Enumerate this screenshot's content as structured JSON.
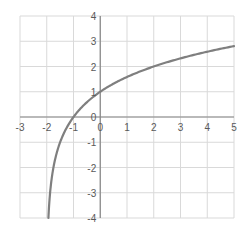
{
  "chart_data": {
    "type": "line",
    "title": "",
    "xlabel": "",
    "ylabel": "",
    "function": "y = log2(x + 2)",
    "xlim": [
      -3,
      5
    ],
    "ylim": [
      -4,
      4
    ],
    "grid": true,
    "legend": null,
    "x_ticks": [
      "-3",
      "-2",
      "-1",
      "0",
      "1",
      "2",
      "3",
      "4",
      "5"
    ],
    "y_ticks": [
      "4",
      "3",
      "2",
      "1",
      "0",
      "-1",
      "-2",
      "-3",
      "-4"
    ],
    "series": [
      {
        "name": "curve",
        "color": "#7f7f7f",
        "x": [
          -1.9375,
          -1.875,
          -1.75,
          -1.5,
          -1.25,
          -1,
          -0.5,
          0,
          0.5,
          1,
          1.5,
          2,
          2.5,
          3,
          3.5,
          4,
          4.5,
          5
        ],
        "y": [
          -4.0,
          -3.0,
          -2.0,
          -1.0,
          -0.415,
          0.0,
          0.585,
          1.0,
          1.322,
          1.585,
          1.807,
          2.0,
          2.17,
          2.322,
          2.459,
          2.585,
          2.7,
          2.807
        ]
      }
    ]
  },
  "colors": {
    "grid": "#d9d9d9",
    "axis": "#868686",
    "curve": "#7f7f7f",
    "tick_text": "#595959"
  }
}
